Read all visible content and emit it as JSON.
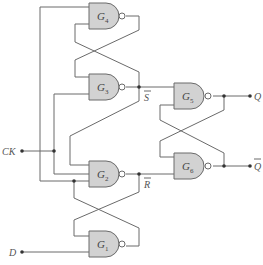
{
  "diagram": {
    "type": "logic-circuit",
    "gates": [
      {
        "id": "G4",
        "letter": "G",
        "sub": "4",
        "kind": "NAND"
      },
      {
        "id": "G3",
        "letter": "G",
        "sub": "3",
        "kind": "NAND"
      },
      {
        "id": "G5",
        "letter": "G",
        "sub": "5",
        "kind": "NAND"
      },
      {
        "id": "G6",
        "letter": "G",
        "sub": "6",
        "kind": "NAND"
      },
      {
        "id": "G2",
        "letter": "G",
        "sub": "2",
        "kind": "NAND"
      },
      {
        "id": "G1",
        "letter": "G",
        "sub": "1",
        "kind": "NAND"
      }
    ],
    "inputs": {
      "ck": "CK",
      "d": "D"
    },
    "outputs": {
      "q": "Q",
      "qbar": "Q"
    },
    "signals": {
      "sbar": "S",
      "rbar": "R"
    }
  }
}
